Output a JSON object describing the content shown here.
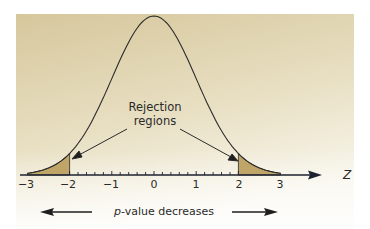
{
  "chart_data": {
    "type": "area",
    "title": "",
    "subtitle": "",
    "xlabel": "Z",
    "ylabel": "",
    "xlim": [
      -3,
      3
    ],
    "ylim": [
      0,
      0.4
    ],
    "grid": false,
    "legend": null,
    "x_ticks": [
      -3,
      -2,
      -1,
      0,
      1,
      2,
      3
    ],
    "x_tick_labels": [
      "−3",
      "−2",
      "−1",
      "0",
      "1",
      "2",
      "3"
    ],
    "minor_tick_step": 0.2,
    "series": [
      {
        "name": "Standard normal density",
        "x": [
          -3,
          -2.5,
          -2,
          -1.5,
          -1,
          -0.5,
          0,
          0.5,
          1,
          1.5,
          2,
          2.5,
          3
        ],
        "values": [
          0.0044,
          0.0175,
          0.054,
          0.1295,
          0.242,
          0.3521,
          0.3989,
          0.3521,
          0.242,
          0.1295,
          0.054,
          0.0175,
          0.0044
        ]
      }
    ],
    "shaded_regions": [
      {
        "name": "Left rejection region",
        "from": -3,
        "to": -2
      },
      {
        "name": "Right rejection region",
        "from": 2,
        "to": 3
      }
    ],
    "annotations": [
      {
        "text": "Rejection regions",
        "points_to": [
          -2,
          2
        ]
      },
      {
        "text": "p-value decreases",
        "arrows": [
          "left",
          "right"
        ]
      }
    ]
  },
  "labels": {
    "axis_name": "Z",
    "ticks": [
      "−3",
      "−2",
      "−1",
      "0",
      "1",
      "2",
      "3"
    ],
    "callout_line1": "Rejection",
    "callout_line2": "regions",
    "pvalue_italic": "p",
    "pvalue_rest": "-value decreases"
  },
  "colors": {
    "panel_top": "#d8c9a0",
    "panel_bottom": "#f6f3e6",
    "shade": "#bfa567",
    "curve": "#2b2b2b",
    "axis": "#1e2230"
  }
}
